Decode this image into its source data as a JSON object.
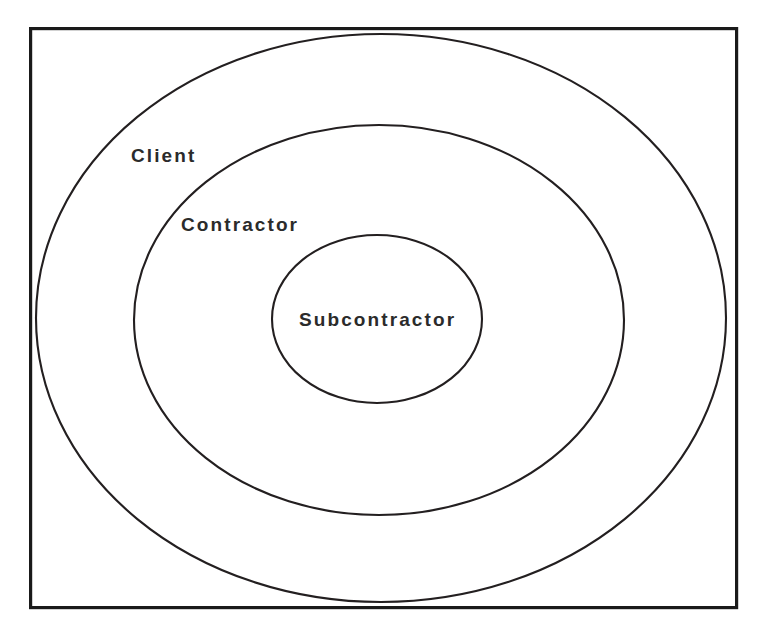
{
  "diagram": {
    "type": "concentric-ellipse-venn",
    "title": "",
    "background_color": "#ffffff",
    "stroke_color": "#231f20",
    "frame_color": "#1a1a1a",
    "text_color": "#2b2b2b",
    "frame": {
      "x": 29,
      "y": 27,
      "width": 709,
      "height": 582
    },
    "rings": [
      {
        "id": "client",
        "label": "Client",
        "level": 1,
        "cx": 381,
        "cy": 318,
        "rx": 346,
        "ry": 285,
        "label_x": 131,
        "label_y": 146
      },
      {
        "id": "contractor",
        "label": "Contractor",
        "level": 2,
        "cx": 379,
        "cy": 320,
        "rx": 245,
        "ry": 195,
        "label_x": 181,
        "label_y": 215
      },
      {
        "id": "subcontractor",
        "label": "Subcontractor",
        "level": 3,
        "cx": 377,
        "cy": 319,
        "rx": 105,
        "ry": 84,
        "label_x": 299,
        "label_y": 310
      }
    ]
  }
}
